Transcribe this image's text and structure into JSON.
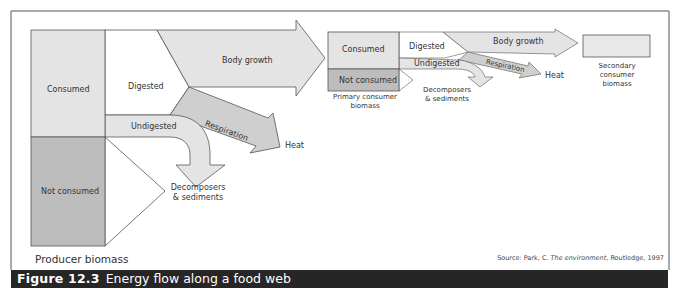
{
  "figure": {
    "number": "Figure 12.3",
    "title": "Energy flow along a food web",
    "source_prefix": "Source: Park, C. ",
    "source_title": "The environment",
    "source_suffix": ", Routledge, 1997"
  },
  "producer": {
    "consumed": "Consumed",
    "not_consumed": "Not consumed",
    "label": "Producer biomass",
    "digested": "Digested",
    "undigested": "Undigested",
    "body_growth": "Body growth",
    "respiration": "Respiration",
    "heat": "Heat",
    "decomposers_1": "Decomposers",
    "decomposers_2": "& sediments"
  },
  "primary": {
    "consumed": "Consumed",
    "not_consumed": "Not consumed",
    "label_1": "Primary consumer",
    "label_2": "biomass",
    "digested": "Digested",
    "undigested": "Undigested",
    "body_growth": "Body growth",
    "respiration": "Respiration",
    "heat": "Heat",
    "decomposers_1": "Decomposers",
    "decomposers_2": "& sediments"
  },
  "secondary": {
    "label_1": "Secondary",
    "label_2": "consumer",
    "label_3": "biomass"
  },
  "colors": {
    "light_fill": "#e4e4e4",
    "dark_fill": "#bdbdbd",
    "mid_fill": "#cfcfcf",
    "stroke": "#555555",
    "caption_bg": "#262626"
  }
}
